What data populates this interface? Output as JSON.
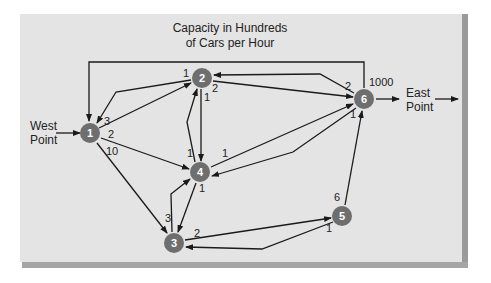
{
  "title": {
    "line1": "Capacity in Hundreds",
    "line2": "of Cars per Hour"
  },
  "source_label": {
    "line1": "West",
    "line2": "Point"
  },
  "sink_label": {
    "line1": "East",
    "line2": "Point"
  },
  "colors": {
    "panel": "#e4e4e4",
    "panel_edge": "#9a9a9a",
    "node_fill": "#6e6e6e",
    "node_text": "#ffffff",
    "edge": "#1a1a1a"
  },
  "nodes": [
    {
      "id": "1",
      "x": 90,
      "y": 133
    },
    {
      "id": "2",
      "x": 202,
      "y": 78
    },
    {
      "id": "3",
      "x": 174,
      "y": 243
    },
    {
      "id": "4",
      "x": 200,
      "y": 172
    },
    {
      "id": "5",
      "x": 342,
      "y": 216
    },
    {
      "id": "6",
      "x": 364,
      "y": 99
    }
  ],
  "capacities": [
    {
      "from": "1",
      "to": "2",
      "value": "3",
      "x": 104,
      "y": 123
    },
    {
      "from": "1",
      "to": "4",
      "value": "2",
      "x": 108,
      "y": 137
    },
    {
      "from": "1",
      "to": "3",
      "value": "10",
      "x": 106,
      "y": 155
    },
    {
      "from": "2",
      "to": "1",
      "value": "1",
      "x": 183,
      "y": 77
    },
    {
      "from": "2",
      "to": "6",
      "value": "2",
      "x": 212,
      "y": 92
    },
    {
      "from": "2",
      "to": "4",
      "value": "1",
      "x": 204,
      "y": 101
    },
    {
      "from": "4",
      "to": "2",
      "value": "1",
      "x": 187,
      "y": 183
    },
    {
      "from": "4",
      "to": "6",
      "value": "1",
      "x": 222,
      "y": 157
    },
    {
      "from": "4",
      "to": "3",
      "value": "1",
      "x": 199,
      "y": 192
    },
    {
      "from": "3",
      "to": "4",
      "value": "3",
      "x": 165,
      "y": 222
    },
    {
      "from": "3",
      "to": "5",
      "value": "2",
      "x": 194,
      "y": 237
    },
    {
      "from": "5",
      "to": "3",
      "value": "1",
      "x": 326,
      "y": 232
    },
    {
      "from": "5",
      "to": "6",
      "value": "6",
      "x": 334,
      "y": 201
    },
    {
      "from": "6",
      "to": "2",
      "value": "2",
      "x": 345,
      "y": 90
    },
    {
      "from": "6",
      "to": "4",
      "value": "1",
      "x": 350,
      "y": 118
    },
    {
      "from": "6",
      "to": "1",
      "value": "1000",
      "x": 369,
      "y": 86
    }
  ]
}
